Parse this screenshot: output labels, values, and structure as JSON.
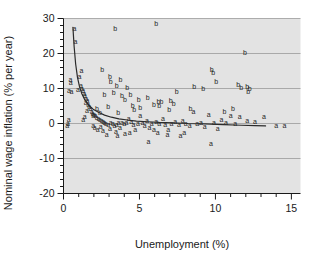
{
  "chart_data": {
    "type": "scatter",
    "title": "",
    "xlabel": "Unemployment (%)",
    "ylabel": "Nominal wage inflation (% per year)",
    "xlim": [
      0,
      15.6
    ],
    "ylim": [
      -20,
      30
    ],
    "x_ticks": [
      0,
      5,
      10,
      15
    ],
    "x_tick_labels": [
      "0",
      "5",
      "10",
      "15"
    ],
    "x_minor_step": 1,
    "y_ticks": [
      -20,
      -10,
      0,
      10,
      20,
      30
    ],
    "y_tick_labels": [
      "-20",
      "-10",
      "0",
      "10",
      "20",
      "30"
    ],
    "y_minor_step": 2,
    "grid": "horizontal-major",
    "grid_color": "#9a9a9a",
    "plot_bg": "#e3e3e3",
    "marker_style": "text-letter",
    "legend": [],
    "series": [
      {
        "name": "a",
        "marker": "a",
        "points": [
          [
            0.72,
            27.3
          ],
          [
            0.78,
            23.4
          ],
          [
            1.18,
            15.2
          ],
          [
            0.45,
            12.6
          ],
          [
            0.48,
            11.7
          ],
          [
            0.36,
            9.6
          ],
          [
            0.52,
            9.3
          ],
          [
            1.15,
            11.0
          ],
          [
            1.22,
            10.1
          ],
          [
            1.3,
            9.4
          ],
          [
            1.36,
            8.6
          ],
          [
            1.42,
            7.9
          ],
          [
            1.5,
            7.2
          ],
          [
            1.58,
            6.6
          ],
          [
            1.46,
            5.9
          ],
          [
            1.62,
            5.4
          ],
          [
            1.7,
            4.8
          ],
          [
            1.78,
            4.3
          ],
          [
            1.55,
            3.8
          ],
          [
            1.85,
            3.5
          ],
          [
            1.92,
            3.0
          ],
          [
            2.02,
            2.6
          ],
          [
            2.1,
            2.2
          ],
          [
            2.18,
            1.8
          ],
          [
            0.35,
            1.1
          ],
          [
            0.3,
            0.1
          ],
          [
            1.4,
            2.0
          ],
          [
            1.3,
            1.1
          ],
          [
            2.3,
            1.5
          ],
          [
            2.4,
            1.1
          ],
          [
            2.52,
            0.8
          ],
          [
            2.62,
            0.5
          ],
          [
            2.7,
            0.2
          ],
          [
            2.8,
            0.0
          ],
          [
            2.95,
            -0.3
          ],
          [
            3.1,
            0.4
          ],
          [
            3.25,
            0.1
          ],
          [
            3.35,
            -0.5
          ],
          [
            3.5,
            -0.2
          ],
          [
            3.62,
            0.3
          ],
          [
            2.05,
            -1.2
          ],
          [
            2.25,
            -1.6
          ],
          [
            2.6,
            -2.0
          ],
          [
            3.05,
            -1.5
          ],
          [
            3.45,
            -2.2
          ],
          [
            3.72,
            -1.0
          ],
          [
            3.85,
            0.2
          ],
          [
            4.0,
            0.0
          ],
          [
            4.15,
            0.4
          ],
          [
            4.3,
            1.5
          ],
          [
            4.45,
            0.7
          ],
          [
            4.6,
            -0.2
          ],
          [
            4.72,
            -1.8
          ],
          [
            4.9,
            0.1
          ],
          [
            5.05,
            2.2
          ],
          [
            5.2,
            0.3
          ],
          [
            5.35,
            -0.4
          ],
          [
            5.5,
            1.0
          ],
          [
            5.65,
            -1.1
          ],
          [
            5.8,
            0.0
          ],
          [
            5.95,
            -1.6
          ],
          [
            6.1,
            0.5
          ],
          [
            6.3,
            -0.1
          ],
          [
            6.55,
            1.6
          ],
          [
            6.7,
            -0.3
          ],
          [
            6.9,
            -1.7
          ],
          [
            7.1,
            0.1
          ],
          [
            7.35,
            0.6
          ],
          [
            7.6,
            -0.2
          ],
          [
            7.85,
            1.0
          ],
          [
            8.05,
            0.0
          ],
          [
            8.3,
            -0.4
          ],
          [
            8.55,
            3.6
          ],
          [
            8.8,
            -0.1
          ],
          [
            9.05,
            0.2
          ],
          [
            9.3,
            -0.7
          ],
          [
            9.55,
            2.6
          ],
          [
            9.7,
            -5.6
          ],
          [
            9.9,
            0.2
          ],
          [
            10.15,
            -1.4
          ],
          [
            10.4,
            1.2
          ],
          [
            10.7,
            0.3
          ],
          [
            11.0,
            2.4
          ],
          [
            11.3,
            0.1
          ],
          [
            11.6,
            2.1
          ],
          [
            12.1,
            1.0
          ],
          [
            12.6,
            0.6
          ],
          [
            13.2,
            2.0
          ],
          [
            14.0,
            -0.4
          ],
          [
            14.55,
            -0.5
          ],
          [
            1.05,
            13.4
          ],
          [
            0.95,
            9.8
          ],
          [
            2.85,
            -3.2
          ],
          [
            3.55,
            -3.4
          ],
          [
            4.05,
            -2.8
          ],
          [
            6.85,
            -3.1
          ],
          [
            7.7,
            -3.5
          ],
          [
            5.6,
            -5.0
          ],
          [
            0.25,
            -0.6
          ],
          [
            1.95,
            -0.6
          ],
          [
            2.45,
            -0.9
          ],
          [
            4.35,
            -2.4
          ],
          [
            6.2,
            -2.4
          ],
          [
            7.95,
            -2.5
          ]
        ]
      },
      {
        "name": "b",
        "marker": "b",
        "points": [
          [
            3.4,
            27.1
          ],
          [
            11.95,
            20.2
          ],
          [
            6.1,
            28.6
          ],
          [
            2.55,
            15.4
          ],
          [
            3.05,
            13.6
          ],
          [
            3.1,
            12.0
          ],
          [
            3.75,
            12.6
          ],
          [
            3.5,
            10.9
          ],
          [
            4.2,
            10.2
          ],
          [
            9.75,
            15.4
          ],
          [
            9.85,
            14.7
          ],
          [
            10.05,
            12.0
          ],
          [
            11.5,
            11.2
          ],
          [
            11.7,
            10.4
          ],
          [
            12.1,
            10.7
          ],
          [
            12.25,
            10.1
          ],
          [
            12.15,
            9.2
          ],
          [
            9.2,
            9.9
          ],
          [
            7.45,
            9.3
          ],
          [
            8.6,
            10.7
          ],
          [
            2.7,
            8.4
          ],
          [
            3.3,
            8.8
          ],
          [
            3.85,
            7.9
          ],
          [
            4.4,
            8.3
          ],
          [
            4.05,
            7.0
          ],
          [
            4.95,
            6.8
          ],
          [
            5.55,
            7.4
          ],
          [
            6.45,
            6.2
          ],
          [
            7.05,
            6.7
          ],
          [
            7.25,
            5.8
          ],
          [
            5.95,
            5.5
          ],
          [
            4.55,
            5.2
          ],
          [
            2.95,
            5.0
          ],
          [
            6.25,
            6.3
          ],
          [
            6.3,
            5.3
          ],
          [
            8.35,
            4.4
          ],
          [
            5.05,
            4.5
          ],
          [
            4.65,
            3.9
          ],
          [
            2.4,
            3.3
          ],
          [
            2.2,
            4.2
          ],
          [
            3.6,
            3.1
          ],
          [
            1.95,
            2.4
          ],
          [
            6.95,
            4.0
          ],
          [
            11.15,
            4.2
          ],
          [
            10.6,
            3.4
          ]
        ]
      }
    ],
    "fit_curve": {
      "name": "fitted-curve",
      "color": "#2b2b2b",
      "points": [
        [
          0.62,
          27.5
        ],
        [
          0.7,
          22.0
        ],
        [
          0.8,
          17.0
        ],
        [
          0.92,
          13.2
        ],
        [
          1.05,
          10.6
        ],
        [
          1.2,
          8.6
        ],
        [
          1.4,
          6.8
        ],
        [
          1.65,
          5.3
        ],
        [
          1.95,
          4.1
        ],
        [
          2.3,
          3.2
        ],
        [
          2.7,
          2.4
        ],
        [
          3.15,
          1.8
        ],
        [
          3.65,
          1.3
        ],
        [
          4.2,
          1.0
        ],
        [
          4.8,
          0.7
        ],
        [
          5.5,
          0.5
        ],
        [
          6.3,
          0.3
        ],
        [
          7.2,
          0.2
        ],
        [
          8.2,
          0.0
        ],
        [
          9.3,
          -0.1
        ],
        [
          10.5,
          -0.3
        ],
        [
          11.7,
          -0.5
        ],
        [
          12.6,
          -0.6
        ],
        [
          13.3,
          -0.7
        ]
      ]
    }
  },
  "figure": {
    "xlabel": "Unemployment (%)",
    "ylabel": "Nominal wage inflation (% per year)"
  }
}
